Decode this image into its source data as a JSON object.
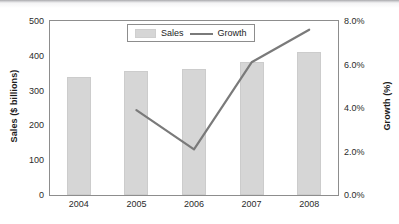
{
  "chart_data": {
    "type": "bar",
    "title": "",
    "subtitle": "",
    "xlabel": "",
    "ylabel": "Sales ($ billions)",
    "y2label": "Growth (%)",
    "categories": [
      "2004",
      "2005",
      "2006",
      "2007",
      "2008"
    ],
    "grid": false,
    "legend_position": "top-center",
    "ylim": [
      0,
      500
    ],
    "y2lim": [
      0,
      8
    ],
    "y_ticks": [
      "0",
      "100",
      "200",
      "300",
      "400",
      "500"
    ],
    "y_tick_values": [
      0,
      100,
      200,
      300,
      400,
      500
    ],
    "y2_ticks": [
      "0.0%",
      "2.0%",
      "4.0%",
      "6.0%",
      "8.0%"
    ],
    "y2_tick_values": [
      0,
      2,
      4,
      6,
      8
    ],
    "series": [
      {
        "name": "Sales",
        "type": "bar",
        "axis": "left",
        "unit": "$ billions",
        "color": "#d6d6d6",
        "values": [
          340,
          355,
          362,
          381,
          412
        ]
      },
      {
        "name": "Growth",
        "type": "line",
        "axis": "right",
        "unit": "%",
        "color": "#7a7a7a",
        "values": [
          null,
          3.9,
          2.1,
          6.1,
          7.6
        ]
      }
    ]
  },
  "legend": {
    "items": [
      {
        "label": "Sales",
        "marker": "bar-swatch",
        "color": "#d6d6d6"
      },
      {
        "label": "Growth",
        "marker": "line-swatch",
        "color": "#7a7a7a"
      }
    ]
  },
  "axes": {
    "left_title": "Sales ($ billions)",
    "right_title": "Growth (%)"
  },
  "colors": {
    "bar_fill": "#d6d6d6",
    "line_stroke": "#7a7a7a",
    "axis_line": "#8d8d8d",
    "text": "#1d1d1d",
    "background": "#ffffff"
  }
}
